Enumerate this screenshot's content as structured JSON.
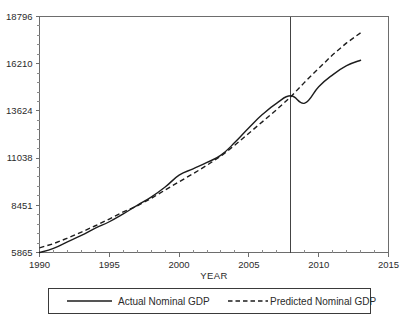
{
  "chart_data": {
    "type": "line",
    "title": "",
    "xlabel": "YEAR",
    "ylabel": "",
    "xlim": [
      1990,
      2015
    ],
    "ylim": [
      5865,
      18796
    ],
    "grid": false,
    "legend_position": "bottom",
    "x_ticks": [
      "1990",
      "1995",
      "2000",
      "2005",
      "2010",
      "2015"
    ],
    "x_tick_values": [
      1990,
      1995,
      2000,
      2005,
      2010,
      2015
    ],
    "y_ticks": [
      "5865",
      "8451",
      "11038",
      "13624",
      "16210",
      "18796"
    ],
    "y_tick_values": [
      5865,
      8451,
      11038,
      13624,
      16210,
      18796
    ],
    "annotations": [
      {
        "name": "recession-marker",
        "type": "vertical-line",
        "x": 2008,
        "label": ""
      }
    ],
    "series": [
      {
        "name": "Actual Nominal GDP",
        "style": "solid",
        "color": "#1d1d1d",
        "x": [
          1990,
          1991,
          1992,
          1993,
          1994,
          1995,
          1996,
          1997,
          1998,
          1999,
          2000,
          2001,
          2002,
          2003,
          2004,
          2005,
          2006,
          2007,
          2008,
          2009,
          2010,
          2011,
          2012,
          2013
        ],
        "values": [
          5865,
          6090,
          6450,
          6800,
          7200,
          7550,
          7980,
          8450,
          8900,
          9450,
          10100,
          10450,
          10800,
          11200,
          11900,
          12700,
          13450,
          14050,
          14450,
          14050,
          14950,
          15600,
          16100,
          16400
        ]
      },
      {
        "name": "Predicted Nominal GDP",
        "style": "dashed",
        "color": "#1d1d1d",
        "x": [
          1990,
          1991,
          1992,
          1993,
          1994,
          1995,
          1996,
          1997,
          1998,
          1999,
          2000,
          2001,
          2002,
          2003,
          2004,
          2005,
          2006,
          2007,
          2008,
          2009,
          2010,
          2011,
          2012,
          2013
        ],
        "values": [
          6120,
          6350,
          6650,
          6980,
          7330,
          7700,
          8090,
          8420,
          8830,
          9290,
          9740,
          10180,
          10650,
          11150,
          11750,
          12400,
          13050,
          13700,
          14400,
          15200,
          15950,
          16700,
          17350,
          17900
        ]
      }
    ],
    "legend": [
      {
        "label": "Actual Nominal GDP",
        "style": "solid"
      },
      {
        "label": "Predicted Nominal GDP",
        "style": "dashed"
      }
    ]
  }
}
